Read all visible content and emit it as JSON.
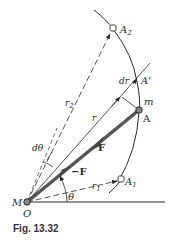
{
  "figure": {
    "caption": "Fig. 13.32",
    "colors": {
      "ink": "#2a2a2a",
      "force_vector": "#555555",
      "background": "#ffffff"
    },
    "labels": {
      "A2": "A",
      "A2_sub": "2",
      "A_prime": "A'",
      "dr": "dr",
      "m": "m",
      "A": "A",
      "r2": "r",
      "r2_sub": "2",
      "r": "r",
      "d_theta": "dθ",
      "F": "F",
      "neg_F": "−F",
      "A1": "A",
      "A1_sub": "1",
      "r1": "r",
      "r1_sub": "1",
      "M": "M",
      "O": "O",
      "theta": "θ"
    }
  }
}
